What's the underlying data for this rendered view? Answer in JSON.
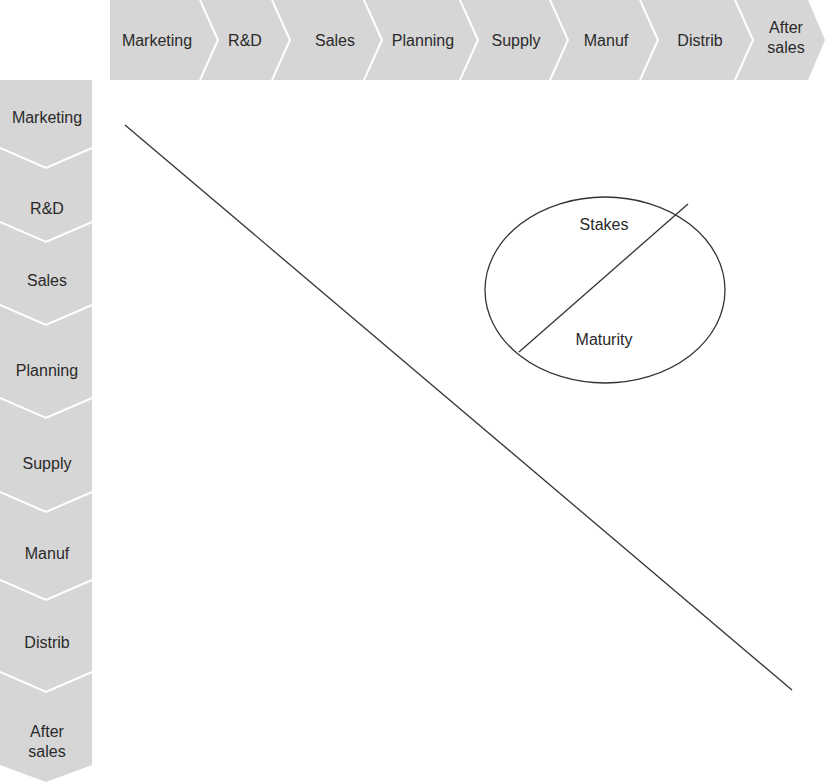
{
  "diagram": {
    "top_axis": {
      "labels": [
        "Marketing",
        "R&D",
        "Sales",
        "Planning",
        "Supply",
        "Manuf",
        "Distrib",
        "After sales"
      ]
    },
    "left_axis": {
      "labels": [
        "Marketing",
        "R&D",
        "Sales",
        "Planning",
        "Supply",
        "Manuf",
        "Distrib",
        "After sales"
      ]
    },
    "legend_circle": {
      "upper_label": "Stakes",
      "lower_label": "Maturity"
    },
    "colors": {
      "chevron_fill": "#d6d6d6",
      "chevron_separator": "#ffffff",
      "line": "#333333",
      "text": "#2a2a2a"
    }
  }
}
